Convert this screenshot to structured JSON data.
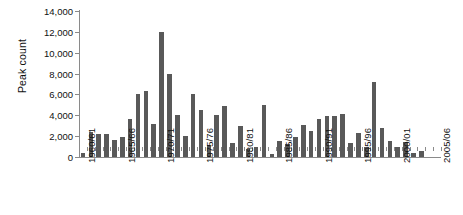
{
  "chart_data": {
    "type": "bar",
    "title": "",
    "subtitle": "",
    "xlabel": "",
    "ylabel": "Peak count",
    "ylim": [
      0,
      14000
    ],
    "ytick_step": 2000,
    "ytick_labels": [
      "0",
      "2,000",
      "4,000",
      "6,000",
      "8,000",
      "10,000",
      "12,000",
      "14,000"
    ],
    "ytick_values": [
      0,
      2000,
      4000,
      6000,
      8000,
      10000,
      12000,
      14000
    ],
    "grid": false,
    "legend": null,
    "legend_position": "none",
    "bar_color": "#595959",
    "axis_color": "#8a8a8a",
    "xtick_labels": [
      "1960/61",
      "1965/66",
      "1970/71",
      "1975/76",
      "1980/81",
      "1985/86",
      "1990/91",
      "1995/96",
      "2000/01",
      "2005/06"
    ],
    "xtick_label_indices": [
      0,
      5,
      10,
      15,
      20,
      25,
      30,
      35,
      40,
      45
    ],
    "categories": [
      "1960/61",
      "1961/62",
      "1962/63",
      "1963/64",
      "1964/65",
      "1965/66",
      "1966/67",
      "1967/68",
      "1968/69",
      "1969/70",
      "1970/71",
      "1971/72",
      "1972/73",
      "1973/74",
      "1974/75",
      "1975/76",
      "1976/77",
      "1977/78",
      "1978/79",
      "1979/80",
      "1980/81",
      "1981/82",
      "1982/83",
      "1983/84",
      "1984/85",
      "1985/86",
      "1986/87",
      "1987/88",
      "1988/89",
      "1989/90",
      "1990/91",
      "1991/92",
      "1992/93",
      "1993/94",
      "1994/95",
      "1995/96",
      "1996/97",
      "1997/98",
      "1998/99",
      "1999/00",
      "2000/01",
      "2001/02",
      "2002/03",
      "2003/04",
      "2004/05",
      "2005/06"
    ],
    "values": [
      400,
      2400,
      2250,
      2200,
      1600,
      1950,
      3600,
      6000,
      6300,
      3200,
      12000,
      8000,
      4000,
      2050,
      6000,
      4500,
      1150,
      4050,
      4900,
      1300,
      3000,
      800,
      1000,
      5000,
      250,
      1550,
      1250,
      1900,
      3100,
      2500,
      3600,
      3950,
      3900,
      4100,
      1300,
      2350,
      1000,
      7200,
      2750,
      1500,
      1000,
      1400,
      400,
      600,
      0,
      0
    ]
  }
}
